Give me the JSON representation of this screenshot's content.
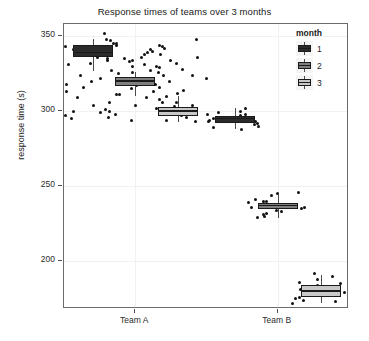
{
  "chart_data": {
    "type": "boxplot",
    "title": "Response times of teams over 3 months",
    "xlabel": "",
    "ylabel": "response time (s)",
    "ylim": [
      168,
      358
    ],
    "yticks": [
      200,
      250,
      300,
      350
    ],
    "ytick_labels": [
      "200",
      "250",
      "300",
      "350"
    ],
    "categories": [
      "Team A",
      "Team B"
    ],
    "grid": true,
    "legend": {
      "title": "month",
      "position": "right",
      "entries": [
        {
          "label": "1",
          "color": "#2b2b2b"
        },
        {
          "label": "2",
          "color": "#7f7f7f"
        },
        {
          "label": "3",
          "color": "#c8c8c8"
        }
      ]
    },
    "groups": [
      {
        "category": "Team A",
        "month": "1",
        "fill": "#2b2b2b",
        "stats": {
          "min": 327,
          "q1": 336,
          "median": 339,
          "q3": 344,
          "max": 348
        },
        "points": [
          352,
          347,
          345,
          344,
          343,
          341,
          340,
          339,
          338,
          337,
          336,
          335,
          334,
          332,
          331,
          329,
          327,
          324,
          322,
          320,
          318,
          316,
          313,
          311,
          309,
          306,
          304,
          301,
          300,
          299,
          297,
          295
        ]
      },
      {
        "category": "Team A",
        "month": "2",
        "fill": "#7f7f7f",
        "stats": {
          "min": 310,
          "q1": 317,
          "median": 320,
          "q3": 323,
          "max": 326
        },
        "points": [
          348,
          345,
          343,
          342,
          340,
          339,
          338,
          336,
          335,
          334,
          333,
          331,
          330,
          329,
          327,
          326,
          325,
          324,
          322,
          321,
          320,
          318,
          317,
          315,
          313,
          311,
          309,
          306,
          304,
          302,
          300,
          298,
          296,
          294
        ]
      },
      {
        "category": "Team A",
        "month": "3",
        "fill": "#c8c8c8",
        "stats": {
          "min": 293,
          "q1": 297,
          "median": 300,
          "q3": 303,
          "max": 310
        },
        "points": [
          348,
          344,
          341,
          338,
          336,
          334,
          332,
          330,
          328,
          326,
          324,
          322,
          320,
          318,
          316,
          314,
          312,
          310,
          308,
          306,
          304,
          303,
          302,
          301,
          300,
          299,
          298,
          297,
          296,
          294,
          293
        ]
      },
      {
        "category": "Team B",
        "month": "1",
        "fill": "#2b2b2b",
        "stats": {
          "min": 288,
          "q1": 292,
          "median": 295,
          "q3": 297,
          "max": 302
        },
        "points": [
          302,
          300,
          299,
          298,
          297,
          296,
          295,
          294,
          293,
          292,
          291,
          290,
          289,
          288,
          294,
          296,
          298,
          295,
          293
        ]
      },
      {
        "category": "Team B",
        "month": "2",
        "fill": "#7f7f7f",
        "stats": {
          "min": 229,
          "q1": 235,
          "median": 237,
          "q3": 239,
          "max": 245
        },
        "points": [
          246,
          245,
          244,
          241,
          240,
          239,
          238,
          237,
          236,
          235,
          234,
          233,
          232,
          231,
          230,
          229,
          238,
          240,
          236
        ]
      },
      {
        "category": "Team B",
        "month": "3",
        "fill": "#c8c8c8",
        "stats": {
          "min": 172,
          "q1": 176,
          "median": 180,
          "q3": 184,
          "max": 191
        },
        "points": [
          192,
          190,
          188,
          186,
          184,
          183,
          182,
          181,
          180,
          179,
          178,
          177,
          176,
          175,
          174,
          173,
          172,
          185,
          181,
          177
        ]
      }
    ]
  }
}
